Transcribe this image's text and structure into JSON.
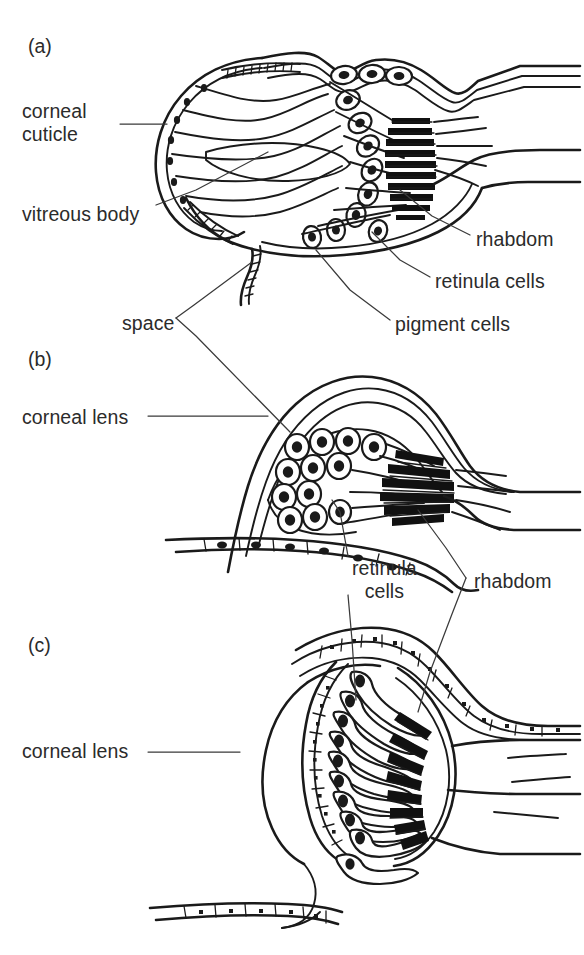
{
  "figure": {
    "background_color": "#ffffff",
    "ink_color": "#1a1a1a",
    "text_color": "#2b2b2b"
  },
  "panels": [
    {
      "id": "panel-a",
      "label": "(a)",
      "x": 28,
      "y": 35
    },
    {
      "id": "panel-b",
      "label": "(b)",
      "x": 28,
      "y": 348
    },
    {
      "id": "panel-c",
      "label": "(c)",
      "x": 28,
      "y": 634
    }
  ],
  "labels": {
    "corneal_cuticle": {
      "text": "corneal\ncuticle",
      "x": 22,
      "y": 100
    },
    "vitreous_body": {
      "text": "vitreous body",
      "x": 22,
      "y": 203
    },
    "space": {
      "text": "space",
      "x": 122,
      "y": 312
    },
    "rhabdom_a": {
      "text": "rhabdom",
      "x": 476,
      "y": 228
    },
    "retinula_cells_a": {
      "text": "retinula cells",
      "x": 435,
      "y": 270
    },
    "pigment_cells_a": {
      "text": "pigment cells",
      "x": 395,
      "y": 313
    },
    "corneal_lens_b": {
      "text": "corneal lens",
      "x": 22,
      "y": 406
    },
    "retinula_cells_m": {
      "text": "retinula\ncells",
      "x": 352,
      "y": 557
    },
    "rhabdom_m": {
      "text": "rhabdom",
      "x": 474,
      "y": 570
    },
    "corneal_lens_c": {
      "text": "corneal lens",
      "x": 22,
      "y": 740
    }
  },
  "structures": {
    "panel_a": {
      "name": "compound-eye-ommatidium-with-corneal-cuticle",
      "features": [
        "corneal cuticle",
        "vitreous body",
        "space",
        "pigment cells",
        "retinula cells",
        "rhabdom",
        "nerve fibres"
      ]
    },
    "panel_b": {
      "name": "eye-with-corneal-lens-and-clustered-retinula-cells",
      "features": [
        "corneal lens",
        "retinula cells",
        "rhabdom",
        "epithelial layer"
      ]
    },
    "panel_c": {
      "name": "eye-with-large-spherical-corneal-lens-and-radial-retina",
      "features": [
        "corneal lens",
        "retinula cells",
        "rhabdom",
        "pigment layer",
        "epithelial layer"
      ]
    }
  }
}
